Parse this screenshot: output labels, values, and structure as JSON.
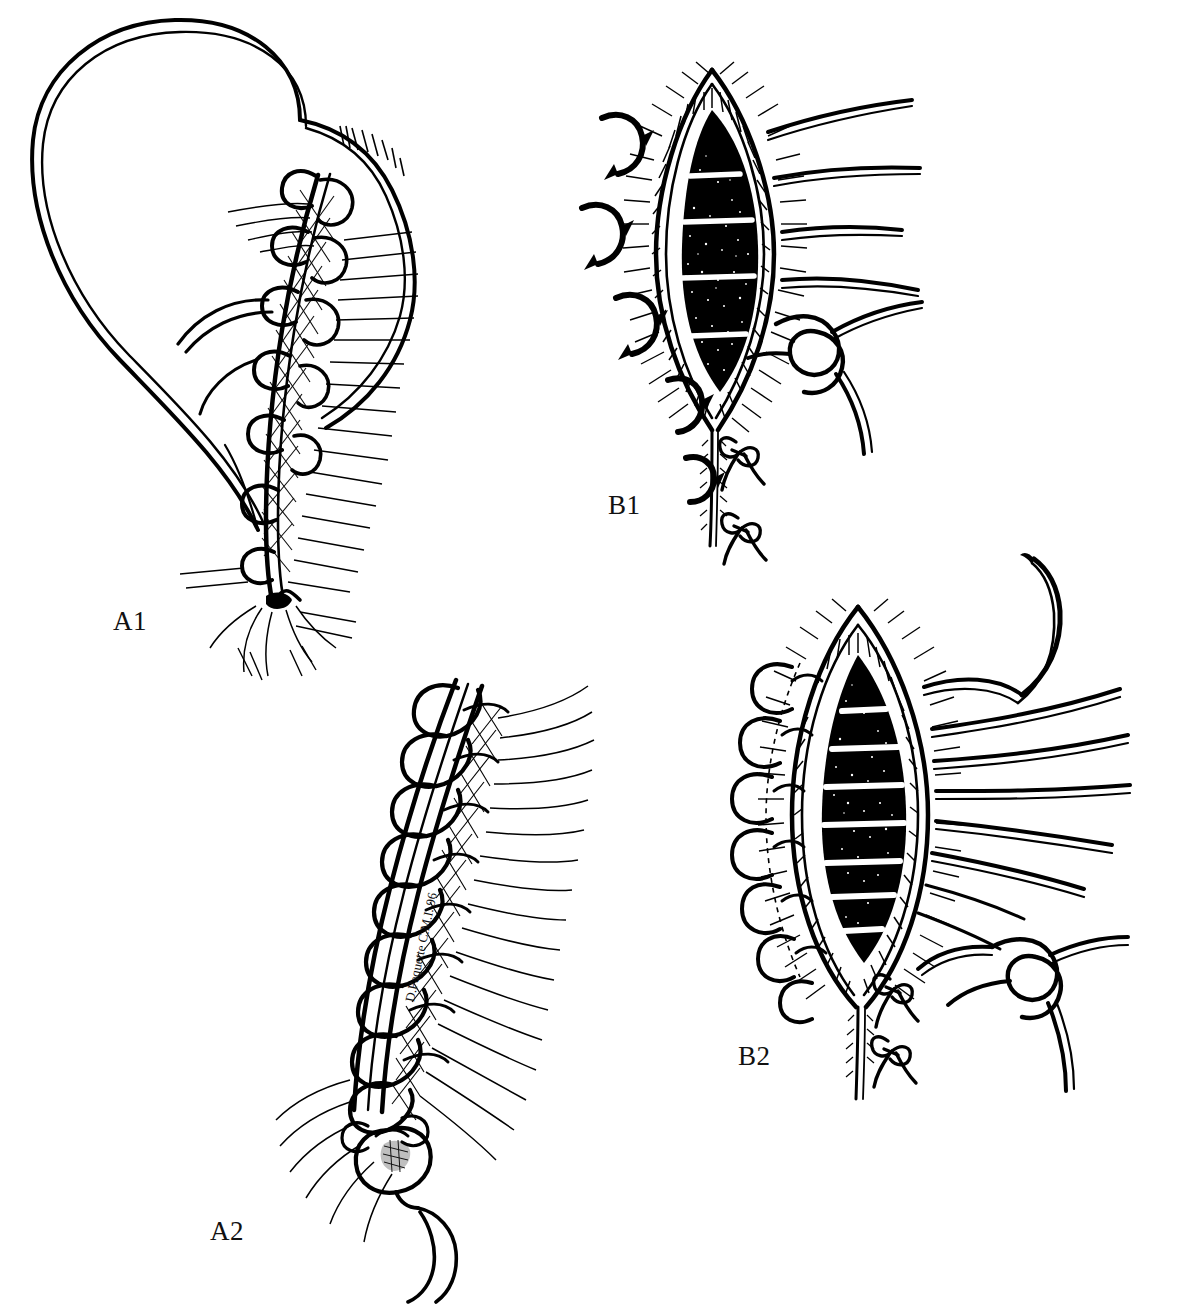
{
  "figure": {
    "kind": "line-art-illustration",
    "medium": "pen-and-ink surgical technique illustration",
    "background_color": "#ffffff",
    "ink_color": "#000000",
    "panel_count": 4
  },
  "panels": [
    {
      "id": "A1",
      "label": "A1",
      "label_x": 113,
      "label_y": 620,
      "caption": "Tissue flap with running suture line begun along the wound edge, loop sutures and crosshatched deep tissue",
      "elements": [
        "tissue-flap-outline",
        "running-suture-line",
        "suture-loops",
        "crosshatch-shading",
        "hatch-shading",
        "terminal-knot"
      ]
    },
    {
      "id": "A2",
      "label": "A2",
      "label_x": 210,
      "label_y": 1218,
      "caption": "Completed continuous locking suture closure with terminal knot and two thread tails",
      "elements": [
        "closed-wound-ridge",
        "locking-suture-chain",
        "crosshatch-shading",
        "hatch-shading",
        "terminal-knot",
        "thread-tails"
      ]
    },
    {
      "id": "B1",
      "label": "B1",
      "label_x": 608,
      "label_y": 504,
      "caption": "Open lens-shaped wound seen en face: dark cavity with white suture bands, four curved approximation arrows at left, four untied suture strands and one tied surgeon's knot at right, two tied bow knots below",
      "elements": [
        "open-wound-cavity",
        "stipple-fill",
        "white-suture-bands",
        "wound-edge-hatching",
        "approximation-arrows",
        "untied-suture-strands",
        "surgeon-knot",
        "tied-bow-knots"
      ]
    },
    {
      "id": "B2",
      "label": "B2",
      "label_x": 738,
      "label_y": 1062,
      "caption": "Same wound with additional sutures placed: seven white suture bands, looped sutures along the left edge, curved needle and many suture strands drawn to the right, tied knots below",
      "elements": [
        "open-wound-cavity",
        "stipple-fill",
        "white-suture-bands",
        "wound-edge-hatching",
        "left-edge-suture-loops",
        "curved-needle",
        "suture-strands",
        "surgeon-knot",
        "tied-bow-knots"
      ]
    }
  ],
  "signature": {
    "text": "D.Paquette C.M.I. 96",
    "artist": "D. Paquette",
    "credential": "C.M.I.",
    "year": "96",
    "rotation_deg": -78
  }
}
